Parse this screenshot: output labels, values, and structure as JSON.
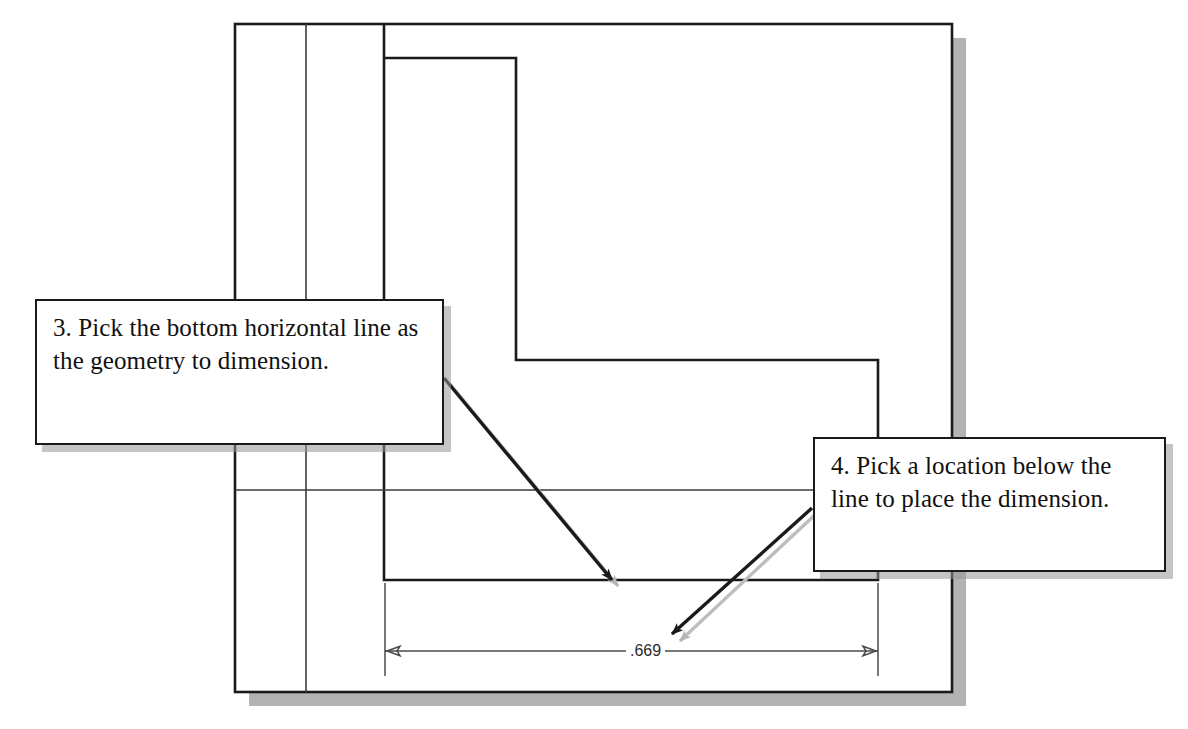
{
  "figure": {
    "kind": "cad-sketch-tutorial-figure",
    "background_color": "#ffffff",
    "line_color": "#1a1a1a",
    "shadow_color": "#999999"
  },
  "callouts": [
    {
      "id": "callout-3",
      "step_number": "3",
      "text": "3. Pick the bottom horizontal line as the geometry to dimension.",
      "box": {
        "x": 35,
        "y": 299,
        "width": 409,
        "height": 146
      }
    },
    {
      "id": "callout-4",
      "step_number": "4",
      "text": "4. Pick a location below the line to place the dimension.",
      "box": {
        "x": 813,
        "y": 437,
        "width": 353,
        "height": 135
      }
    }
  ],
  "arrows": [
    {
      "id": "arrow-callout-3",
      "from": {
        "x": 444,
        "y": 378
      },
      "to": {
        "x": 612,
        "y": 580
      },
      "points_at": "bottom-horizontal-line"
    },
    {
      "id": "arrow-callout-4",
      "from": {
        "x": 812,
        "y": 508
      },
      "to": {
        "x": 672,
        "y": 634
      },
      "points_at": "dimension-placement-location"
    }
  ],
  "dimension": {
    "value_label": ".669",
    "line_y": 651,
    "left_x": 385,
    "right_x": 878,
    "text_center_x": 648,
    "arrowhead_style": "outward-ticks"
  },
  "geometry": {
    "sheet_border": {
      "x": 235,
      "y": 24,
      "width": 717,
      "height": 668
    },
    "margin_line_x": 306,
    "l_shape": {
      "left_x": 384,
      "top_y": 58,
      "right_x": 878,
      "step_y": 360,
      "inner_x": 516,
      "bottom_y": 580
    },
    "horizontal_rule_y": 490
  }
}
